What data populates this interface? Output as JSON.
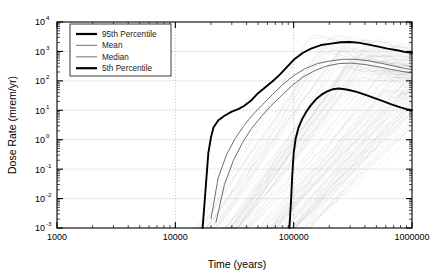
{
  "chart_data": {
    "type": "line",
    "title": "",
    "xlabel": "Time (years)",
    "ylabel": "Dose Rate (mrem/yr)",
    "xscale": "log",
    "yscale": "log",
    "xlim": [
      1000,
      1000000
    ],
    "ylim": [
      0.001,
      10000
    ],
    "grid": true,
    "legend_position": "upper left",
    "x_tick_labels": [
      "1000",
      "10000",
      "100000",
      "1000000"
    ],
    "x_tick_values": [
      1000,
      10000,
      100000,
      1000000
    ],
    "y_tick_labels": [
      "10",
      "10",
      "10",
      "10",
      "10",
      "10",
      "10",
      "10"
    ],
    "y_tick_exponents": [
      "4",
      "3",
      "2",
      "1",
      "0",
      "-1",
      "-2",
      "-3"
    ],
    "y_tick_values": [
      10000,
      1000,
      100,
      10,
      1,
      0.1,
      0.01,
      0.001
    ],
    "legend": [
      {
        "label": "95th Percentile",
        "style": "thick-black"
      },
      {
        "label": "Mean",
        "style": "thin-gray"
      },
      {
        "label": "Median",
        "style": "thin-gray"
      },
      {
        "label": "5th Percentile",
        "style": "thick-black"
      }
    ],
    "series": [
      {
        "name": "95th Percentile",
        "style": "thick-black",
        "x": [
          17000,
          18000,
          19000,
          20000,
          21000,
          23000,
          26000,
          30000,
          34000,
          38000,
          44000,
          50000,
          58000,
          66000,
          76000,
          88000,
          100000,
          120000,
          140000,
          170000,
          200000,
          250000,
          300000,
          360000,
          430000,
          520000,
          620000,
          750000,
          880000,
          1000000
        ],
        "y": [
          0.001,
          0.02,
          0.35,
          1.2,
          2.6,
          4.5,
          6.5,
          9.0,
          11.0,
          14.0,
          22.0,
          38.0,
          62.0,
          95.0,
          160.0,
          300.0,
          520.0,
          900.0,
          1250.0,
          1650.0,
          1800.0,
          2050.0,
          2100.0,
          1950.0,
          1700.0,
          1450.0,
          1250.0,
          1100.0,
          950.0,
          900.0
        ]
      },
      {
        "name": "Mean",
        "style": "thin-gray",
        "x": [
          20000,
          23000,
          27000,
          32000,
          38000,
          45000,
          55000,
          66000,
          80000,
          100000,
          125000,
          160000,
          200000,
          260000,
          330000,
          420000,
          540000,
          700000,
          850000,
          1000000
        ],
        "y": [
          0.002,
          0.05,
          0.3,
          1.1,
          3.0,
          7.0,
          16.0,
          34.0,
          72.0,
          150.0,
          260.0,
          390.0,
          470.0,
          540.0,
          540.0,
          490.0,
          400.0,
          320.0,
          270.0,
          240.0
        ]
      },
      {
        "name": "Median",
        "style": "thin-gray",
        "x": [
          22000,
          26000,
          31000,
          37000,
          44000,
          53000,
          64000,
          78000,
          95000,
          118000,
          150000,
          190000,
          245000,
          310000,
          400000,
          520000,
          670000,
          850000,
          1000000
        ],
        "y": [
          0.0015,
          0.03,
          0.2,
          0.8,
          2.4,
          6.0,
          14.0,
          30.0,
          64.0,
          130.0,
          220.0,
          320.0,
          390.0,
          400.0,
          360.0,
          300.0,
          245.0,
          205.0,
          185.0
        ]
      },
      {
        "name": "5th Percentile",
        "style": "thick-black",
        "x": [
          92000,
          95000,
          97000,
          100000,
          104000,
          110000,
          118000,
          128000,
          140000,
          155000,
          172000,
          192000,
          215000,
          240000,
          270000,
          300000,
          340000,
          400000,
          470000,
          560000,
          670000,
          800000,
          900000,
          1000000
        ],
        "y": [
          0.001,
          0.008,
          0.05,
          0.35,
          1.1,
          2.6,
          5.0,
          9.0,
          15.0,
          24.0,
          34.0,
          44.0,
          52.0,
          55.0,
          52.0,
          48.0,
          42.0,
          34.0,
          27.0,
          21.0,
          16.0,
          12.5,
          11.0,
          10.0
        ]
      }
    ],
    "realization_band": {
      "description": "Many individual realization curves (light gray spaghetti) rising between ~15000 and ~150000 years, spanning roughly 10^-3 to 10^3.5 mrem/yr",
      "count": 120
    }
  }
}
